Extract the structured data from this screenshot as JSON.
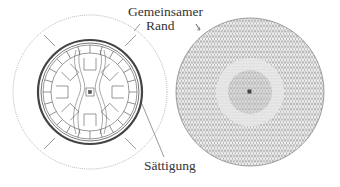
{
  "labels": {
    "common_boundary_line1": "Gemeinsamer",
    "common_boundary_line2": "Rand",
    "saturation": "Sättigung"
  },
  "figures": {
    "left": {
      "description": "motor cross-section with field lines and outer air region",
      "center": [
        90,
        92
      ]
    },
    "right": {
      "description": "triangular finite-element mesh of circular domain",
      "center": [
        250,
        92
      ]
    }
  },
  "colors": {
    "line": "#555555",
    "text": "#333333",
    "background": "#ffffff"
  }
}
